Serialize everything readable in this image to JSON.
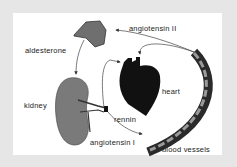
{
  "diagram": {
    "labels": {
      "angiotensin_ii": "angiotensin II",
      "aldesterone": "aldesterone",
      "heart": "heart",
      "kidney": "kidney",
      "rennin": "rennin",
      "angiotensin_i": "angiotensin I",
      "blood_vessels": "blood vessels"
    },
    "nodes": [
      {
        "id": "adrenal-gland",
        "shape": "gray blob"
      },
      {
        "id": "heart",
        "shape": "black heart"
      },
      {
        "id": "kidney",
        "shape": "gray kidney"
      },
      {
        "id": "blood-vessel",
        "shape": "dark curved tube"
      }
    ],
    "edges": [
      {
        "from": "blood-vessel",
        "to": "adrenal-gland",
        "label": "angiotensin II"
      },
      {
        "from": "blood-vessel",
        "to": "heart",
        "label": "angiotensin II"
      },
      {
        "from": "adrenal-gland",
        "to": "kidney",
        "label": "aldesterone"
      },
      {
        "from": "kidney",
        "to": "heart",
        "label": ""
      },
      {
        "from": "kidney",
        "to": "blood-vessel",
        "label": "rennin / angiotensin I"
      }
    ],
    "colors": {
      "background": "#e6e6e6",
      "panel": "#ffffff",
      "organ_gray": "#7a7a7a",
      "heart": "#111111",
      "vessel_dark": "#2a2a2a",
      "vessel_light": "#9a9a9a"
    }
  }
}
